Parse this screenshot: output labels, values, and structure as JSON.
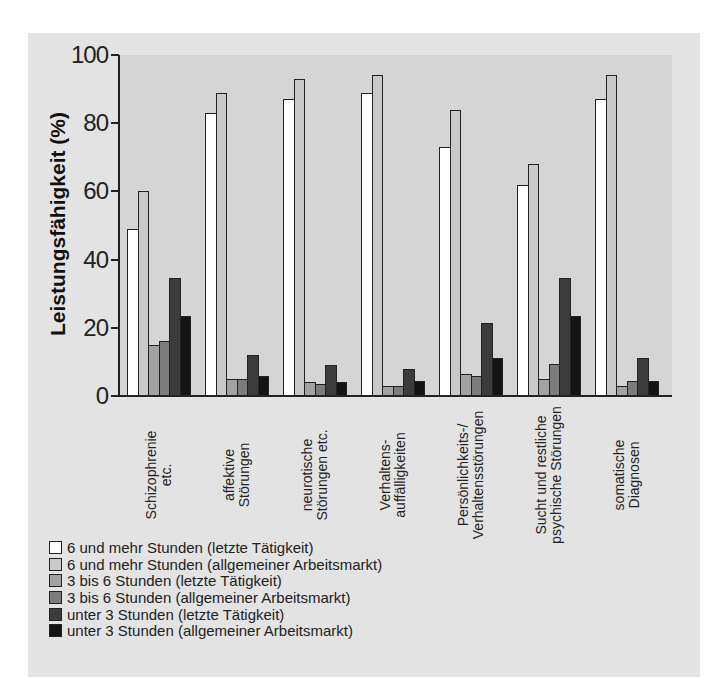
{
  "chart_data": {
    "type": "bar",
    "title": "",
    "xlabel": "",
    "ylabel": "Leistungsfähigkeit (%)",
    "ylim": [
      0,
      100
    ],
    "yticks": [
      0,
      20,
      40,
      60,
      80,
      100
    ],
    "grid": false,
    "legend_position": "bottom",
    "categories": [
      "Schizophrenie etc.",
      "affektive Störungen",
      "neurotische Störungen etc.",
      "Verhaltensauffälligkeiten",
      "Persönlichkeits-/Verhaltensstörungen",
      "Sucht und restliche psychische Störungen",
      "somatische Diagnosen"
    ],
    "category_lines": [
      [
        "Schizophrenie",
        "etc."
      ],
      [
        "affektive",
        "Störungen"
      ],
      [
        "neurotische",
        "Störungen etc."
      ],
      [
        "Verhaltens-",
        "auffälligkeiten"
      ],
      [
        "Persönlichkeits-/",
        "Verhaltensstörungen"
      ],
      [
        "Sucht und restliche",
        "psychische Störungen"
      ],
      [
        "somatische",
        "Diagnosen"
      ]
    ],
    "series": [
      {
        "name": "6 und mehr Stunden (letzte Tätigkeit)",
        "color": "#ffffff",
        "values": [
          49,
          83,
          87,
          89,
          73,
          62,
          87
        ]
      },
      {
        "name": "6 und mehr Stunden (allgemeiner Arbeitsmarkt)",
        "color": "#c9c9c9",
        "values": [
          60,
          89,
          93,
          94,
          84,
          68,
          94
        ]
      },
      {
        "name": "3 bis 6 Stunden (letzte Tätigkeit)",
        "color": "#a2a2a2",
        "values": [
          15,
          5,
          4,
          3,
          6.5,
          5,
          3
        ]
      },
      {
        "name": "3 bis 6 Stunden (allgemeiner Arbeitsmarkt)",
        "color": "#7c7c7c",
        "values": [
          16,
          5,
          3.5,
          3,
          6,
          9.5,
          4.5
        ]
      },
      {
        "name": "unter 3 Stunden (letzte Tätigkeit)",
        "color": "#3c3c3c",
        "values": [
          34.5,
          12,
          9,
          8,
          21.5,
          34.5,
          11
        ]
      },
      {
        "name": "unter 3 Stunden (allgemeiner Arbeitsmarkt)",
        "color": "#141414",
        "values": [
          23.5,
          6,
          4,
          4.5,
          11,
          23.5,
          4.5
        ]
      }
    ]
  },
  "axis": {
    "ylabel": "Leistungsfähigkeit (%)",
    "ticks": [
      "0",
      "20",
      "40",
      "60",
      "80",
      "100"
    ]
  },
  "legend": [
    "6 und mehr Stunden (letzte Tätigkeit)",
    "6 und mehr Stunden (allgemeiner Arbeitsmarkt)",
    "3 bis 6 Stunden (letzte Tätigkeit)",
    "3 bis 6 Stunden (allgemeiner Arbeitsmarkt)",
    "unter 3 Stunden (letzte Tätigkeit)",
    "unter 3 Stunden (allgemeiner Arbeitsmarkt)"
  ]
}
